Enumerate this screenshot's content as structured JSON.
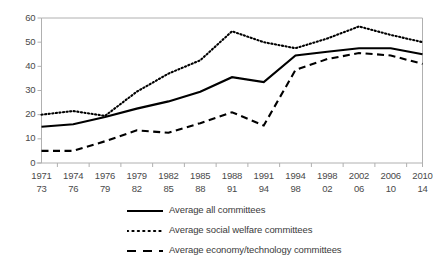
{
  "chart_data": {
    "type": "line",
    "title": "",
    "xlabel": "",
    "ylabel": "",
    "ylim": [
      0,
      60
    ],
    "yticks": [
      0,
      10,
      20,
      30,
      40,
      50,
      60
    ],
    "grid": false,
    "legend_position": "bottom",
    "categories": [
      "1971\n73",
      "1974\n76",
      "1976\n79",
      "1979\n82",
      "1982\n85",
      "1985\n88",
      "1988\n91",
      "1991\n94",
      "1994\n98",
      "1998\n02",
      "2002\n06",
      "2006\n10",
      "2010\n14"
    ],
    "category_lines": [
      {
        "top": "1971",
        "bottom": "73"
      },
      {
        "top": "1974",
        "bottom": "76"
      },
      {
        "top": "1976",
        "bottom": "79"
      },
      {
        "top": "1979",
        "bottom": "82"
      },
      {
        "top": "1982",
        "bottom": "85"
      },
      {
        "top": "1985",
        "bottom": "88"
      },
      {
        "top": "1988",
        "bottom": "91"
      },
      {
        "top": "1991",
        "bottom": "94"
      },
      {
        "top": "1994",
        "bottom": "98"
      },
      {
        "top": "1998",
        "bottom": "02"
      },
      {
        "top": "2002",
        "bottom": "06"
      },
      {
        "top": "2006",
        "bottom": "10"
      },
      {
        "top": "2010",
        "bottom": "14"
      }
    ],
    "series": [
      {
        "name": "Average all committees",
        "style": "solid",
        "color": "#000000",
        "values": [
          15.0,
          16.0,
          19.0,
          22.5,
          25.5,
          29.5,
          35.5,
          33.5,
          44.5,
          46.0,
          47.5,
          47.5,
          45.0
        ]
      },
      {
        "name": "Average social welfare committees",
        "style": "dotted",
        "color": "#000000",
        "values": [
          20.0,
          21.5,
          19.5,
          29.5,
          37.0,
          42.5,
          54.5,
          50.0,
          47.5,
          51.5,
          56.5,
          53.0,
          50.0
        ]
      },
      {
        "name": "Average economy/technology committees",
        "style": "dashed",
        "color": "#000000",
        "values": [
          5.0,
          5.0,
          9.0,
          13.5,
          12.5,
          16.5,
          21.0,
          15.5,
          38.5,
          43.0,
          45.5,
          44.5,
          41.0
        ]
      }
    ]
  },
  "legend": {
    "items": [
      {
        "label": "Average all committees",
        "style": "solid"
      },
      {
        "label": "Average social welfare committees",
        "style": "dotted"
      },
      {
        "label": "Average economy/technology committees",
        "style": "dashed"
      }
    ]
  },
  "axis": {
    "y_labels": [
      "60",
      "50",
      "40",
      "30",
      "20",
      "10",
      "0"
    ],
    "axis_color": "#b0b0b0"
  }
}
